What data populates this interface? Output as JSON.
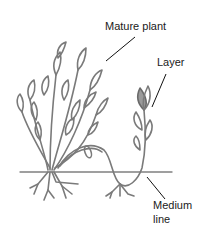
{
  "diagram": {
    "labels": {
      "mature_plant": "Mature plant",
      "layer": "Layer",
      "medium_line_1": "Medium",
      "medium_line_2": "line"
    },
    "colors": {
      "plant_stroke": "#7a7a7a",
      "leader_line": "#111111",
      "ground_line": "#808080",
      "background": "#ffffff"
    }
  }
}
